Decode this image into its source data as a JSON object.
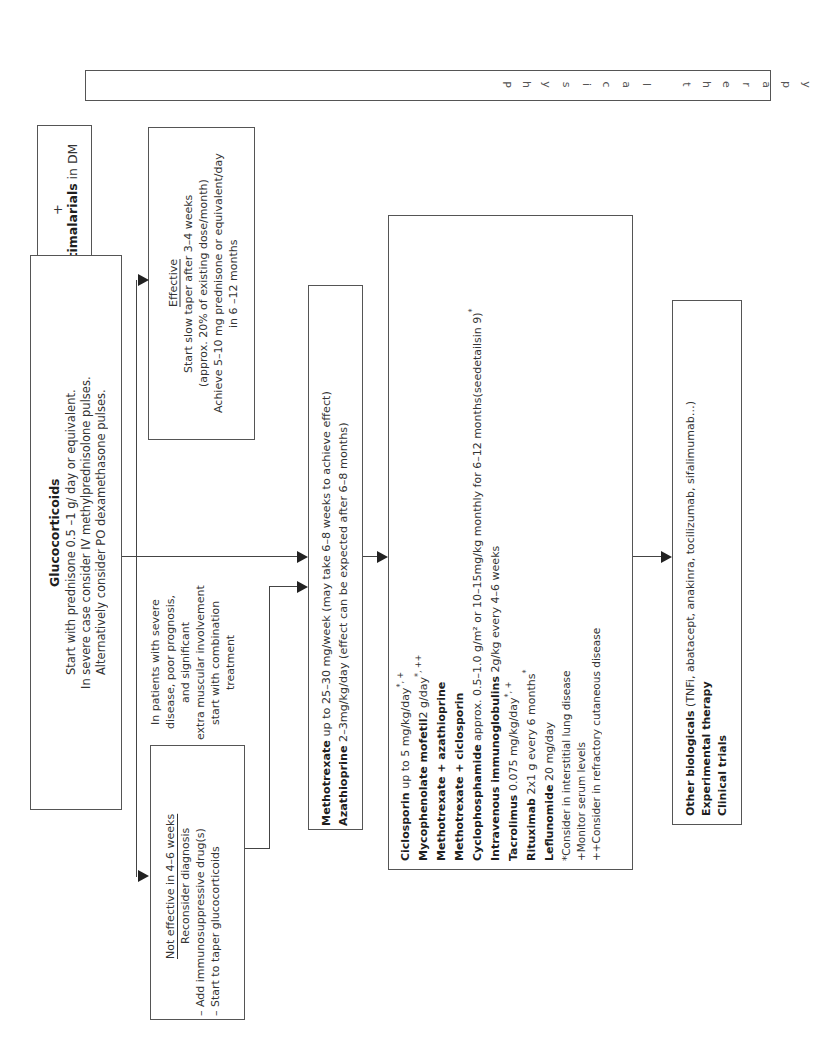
{
  "physical_therapy": {
    "letters": [
      "P",
      "h",
      "y",
      "s",
      "i",
      "c",
      "a",
      "l",
      " ",
      "t",
      "h",
      "e",
      "r",
      "a",
      "p",
      "y"
    ]
  },
  "antimalarials": {
    "plus": "+",
    "name": "Antimalarials",
    "suffix": " in DM"
  },
  "glucocorticoids": {
    "title": "Glucocorticoids",
    "lines": [
      "Start with prednisone 0.5 –1 g/ day or equivalent.",
      "In severe case consider IV methylprednisolone pulses.",
      "Alternatively consider PO dexamethasone  pulses."
    ]
  },
  "effective": {
    "title": "Effective",
    "lines": [
      "Start slow taper after 3–4 weeks",
      "(approx. 20% of existing dose/month)",
      "Achieve 5–10 mg prednisone or equivalent/day",
      "in 6 –12 months"
    ]
  },
  "severe_note": {
    "lines": [
      "In patients with severe",
      "disease, poor prognosis,",
      "and significant",
      "extra muscular involvement",
      "start with combination",
      "treatment"
    ]
  },
  "not_effective": {
    "title": "Not effective in 4–6 weeks",
    "lines": [
      "Reconsider diagnosis",
      "– Add immunosuppressive drug(s)",
      "– Start to taper glucocorticoids"
    ]
  },
  "first_line": {
    "items": [
      {
        "drug": "Methotrexate",
        "dose": " up to 25–30 mg/week (may take 6–8 weeks to achieve effect)"
      },
      {
        "drug": "Azathioprine",
        "dose": " 2–3mg/kg/day (effect can be expected after 6–8 months)"
      }
    ]
  },
  "second_line": {
    "items": [
      {
        "drug": "Ciclosporin",
        "dose": " up to 5 mg/kg/day",
        "sup": "*, +"
      },
      {
        "drug": "Mycophenolate mofetil",
        "dose": "2 g/day",
        "sup": "*, ++"
      },
      {
        "drug": "Methotrexate + azathioprine",
        "dose": "",
        "sup": ""
      },
      {
        "drug": "Methotrexate + ciclosporin",
        "dose": "",
        "sup": ""
      },
      {
        "drug": "Cyclophosphamide",
        "dose": " approx. 0.5–1.0 g/m² or 10–15mg/kg monthly for 6–12 months(seedetailsin 9)",
        "sup": "*"
      },
      {
        "drug": "Intravenous immunoglobulins",
        "dose": " 2g/kg every 4–6 weeks",
        "sup": ""
      },
      {
        "drug": "Tacrolimus",
        "dose": " 0.075 mg/kg/day",
        "sup": "*, +"
      },
      {
        "drug": "Rituximab",
        "dose": " 2x1 g every 6 months",
        "sup": "*"
      },
      {
        "drug": "Leflunomide",
        "dose": " 20 mg/day",
        "sup": ""
      }
    ],
    "footnotes": [
      {
        "mark": "*",
        "text": "Consider in interstitial lung disease"
      },
      {
        "mark": "+",
        "text": "Monitor serum levels"
      },
      {
        "mark": "++",
        "text": "Consider in refractory cutaneous disease"
      }
    ]
  },
  "third_line": {
    "items": [
      {
        "drug": "Other biologicals",
        "dose": " (TNFi, abatacept, anakinra, tocilizumab, sifalimumab…)"
      },
      {
        "drug": "Experimental therapy",
        "dose": ""
      },
      {
        "drug": "Clinical trials",
        "dose": ""
      }
    ]
  }
}
